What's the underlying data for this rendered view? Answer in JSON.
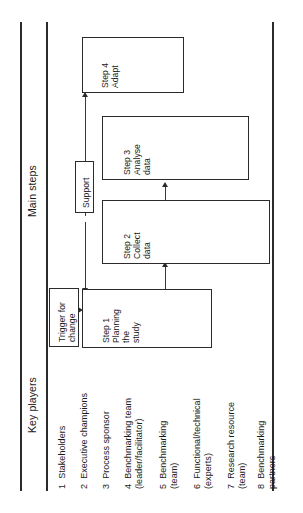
{
  "figure": {
    "orientation": "rotated-90-ccw",
    "line_color": "#2b2b2b",
    "background": "#ffffff"
  },
  "headers": {
    "main_steps": "Main steps",
    "key_players": "Key players"
  },
  "key_players": [
    {
      "number": "1",
      "label": "Stakeholders",
      "line2": ""
    },
    {
      "number": "2",
      "label": "Executive champions",
      "line2": ""
    },
    {
      "number": "3",
      "label": "Process sponsor",
      "line2": ""
    },
    {
      "number": "4",
      "label": "Benchmarking team",
      "line2": "(leader/facilitator)"
    },
    {
      "number": "5",
      "label": "Benchmarking",
      "line2": "(team)"
    },
    {
      "number": "6",
      "label": "Functional/technical",
      "line2": "(experts)"
    },
    {
      "number": "7",
      "label": "Research resource",
      "line2": "(team)"
    },
    {
      "number": "8",
      "label": "Benchmarking",
      "line2": "partners"
    }
  ],
  "boxes": {
    "trigger": {
      "line1": "Trigger for",
      "line2": "change"
    },
    "support": {
      "line1": "Support"
    },
    "step1": {
      "line1": "Step 1",
      "line2": "Planning",
      "line3": "the",
      "line4": "study"
    },
    "step2": {
      "line1": "Step 2",
      "line2": "Collect",
      "line3": "data"
    },
    "step3": {
      "line1": "Step 3",
      "line2": "Analyse",
      "line3": "data"
    },
    "step4": {
      "line1": "Step 4",
      "line2": "Adapt"
    }
  }
}
